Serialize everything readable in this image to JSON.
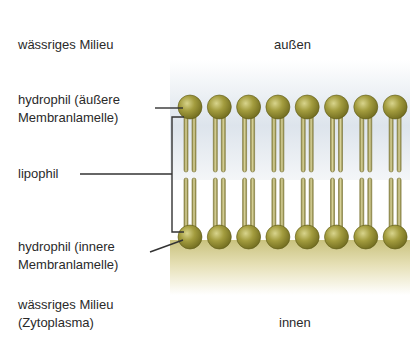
{
  "labels": {
    "outer_medium": "wässriges Milieu",
    "outside": "außen",
    "hydrophil_outer_line1": "hydrophil (äußere",
    "hydrophil_outer_line2": "Membranlamelle)",
    "lipophil": "lipophil",
    "hydrophil_inner_line1": "hydrophil (innere",
    "hydrophil_inner_line2": "Membranlamelle)",
    "inner_medium_line1": "wässriges Milieu",
    "inner_medium_line2": "(Zytoplasma)",
    "inside": "innen"
  },
  "diagram": {
    "type": "phospholipid bilayer",
    "lipid_pairs": 8,
    "head_color": "#8f8a2e",
    "tail_color": "#b9b068",
    "outer_bg_color": "#dfe6ee",
    "inner_bg_color": "#cfc889"
  }
}
